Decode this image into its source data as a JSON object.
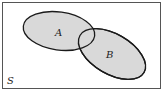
{
  "diagram": {
    "type": "venn",
    "universe": {
      "label": "S"
    },
    "sets": [
      {
        "label": "A"
      },
      {
        "label": "B"
      }
    ],
    "colors": {
      "fill": "#d9d9d9",
      "stroke": "#1a1a1a",
      "border": "#555555",
      "background": "#ffffff"
    }
  }
}
